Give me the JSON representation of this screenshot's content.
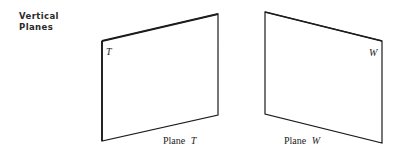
{
  "heading": {
    "line1": "Vertical",
    "line2": "Planes"
  },
  "planes": [
    {
      "id": "T",
      "corner_label": "T",
      "caption_prefix": "Plane",
      "caption_letter": "T",
      "points": "102,41 218,14 218,115 102,141"
    },
    {
      "id": "W",
      "corner_label": "W",
      "caption_prefix": "Plane",
      "caption_letter": "W",
      "points": "265,12 382,41 382,143 265,114"
    }
  ],
  "colors": {
    "stroke": "#1c1c1c",
    "background": "#ffffff"
  }
}
